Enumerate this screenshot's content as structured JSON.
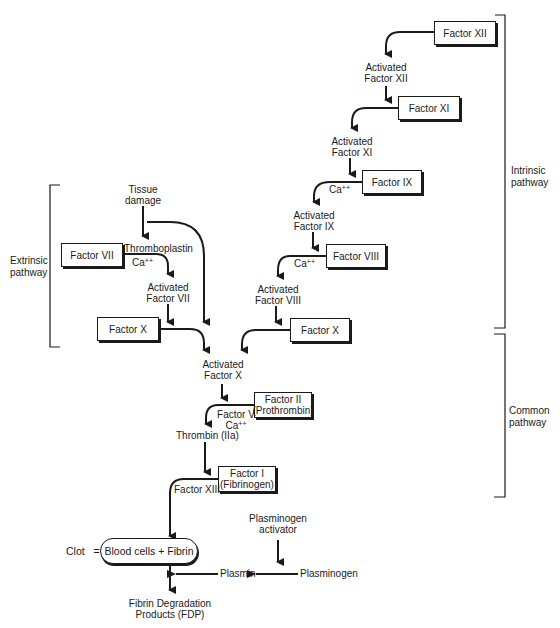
{
  "diagram": {
    "factors": {
      "f12": "Factor XII",
      "f11": "Factor XI",
      "f9": "Factor IX",
      "f8": "Factor VIII",
      "f10_intrinsic": "Factor X",
      "f7": "Factor VII",
      "f10_extrinsic": "Factor X",
      "f2_line1": "Factor II",
      "f2_line2": "(Prothrombin)",
      "f1_line1": "Factor I",
      "f1_line2": "(Fibrinogen)"
    },
    "activated": {
      "a12_l1": "Activated",
      "a12_l2": "Factor XII",
      "a11_l1": "Activated",
      "a11_l2": "Factor XI",
      "a9_l1": "Activated",
      "a9_l2": "Factor IX",
      "a8_l1": "Activated",
      "a8_l2": "Factor VIII",
      "a7_l1": "Activated",
      "a7_l2": "Factor VII",
      "a10_l1": "Activated",
      "a10_l2": "Factor X"
    },
    "cofactors": {
      "ca_base": "Ca",
      "ca_sup": "++",
      "thromboplastin": "Thromboplastin",
      "factor5": "Factor V",
      "factor13": "Factor XIII"
    },
    "tissue": {
      "l1": "Tissue",
      "l2": "damage"
    },
    "thrombin": "Thrombin (IIa)",
    "clot": {
      "prefix": "Clot",
      "equals": "=",
      "content": "Blood cells + Fibrin"
    },
    "plasminogen_activator": {
      "l1": "Plasminogen",
      "l2": "activator"
    },
    "plasminogen": "Plasminogen",
    "plasmin": "Plasmin",
    "fdp": {
      "l1": "Fibrin Degradation",
      "l2": "Products (FDP)"
    },
    "pathways": {
      "intrinsic": {
        "l1": "Intrinsic",
        "l2": "pathway"
      },
      "extrinsic": {
        "l1": "Extrinsic",
        "l2": "pathway"
      },
      "common": {
        "l1": "Common",
        "l2": "pathway"
      }
    }
  }
}
